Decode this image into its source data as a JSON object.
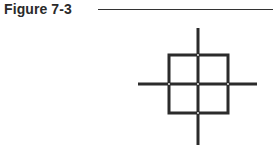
{
  "figure": {
    "label": "Figure 7-3",
    "diagram": {
      "description": "Square divided into four quadrants by crosshair lines extending beyond its edges",
      "stroke_color": "#2b2b2b",
      "stroke_width": 3,
      "square": {
        "x": 169,
        "y": 55,
        "width": 59,
        "height": 58
      },
      "vertical_line": {
        "x": 198,
        "y1": 28,
        "y2": 145
      },
      "horizontal_line": {
        "y": 84,
        "x1": 138,
        "x2": 257
      },
      "junction_dots": [
        {
          "x": 198,
          "y": 55
        },
        {
          "x": 169,
          "y": 84
        },
        {
          "x": 198,
          "y": 84
        },
        {
          "x": 228,
          "y": 84
        },
        {
          "x": 198,
          "y": 113
        }
      ]
    }
  }
}
